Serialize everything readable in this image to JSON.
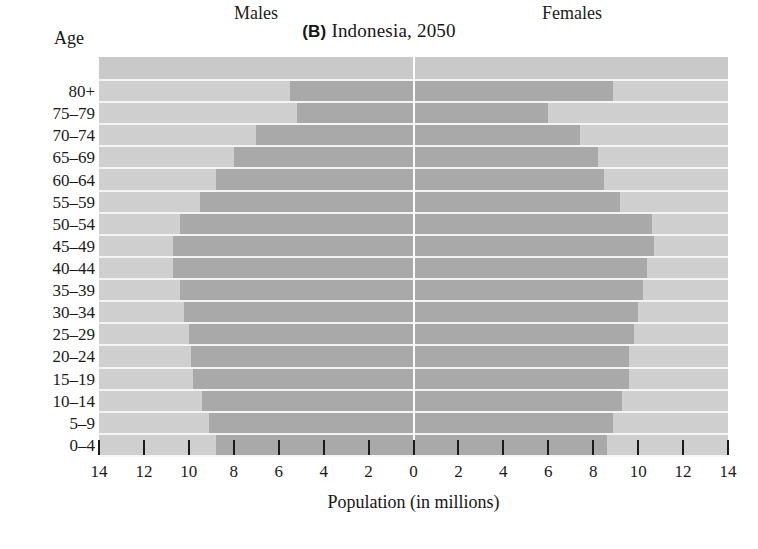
{
  "title": {
    "panel": "(B)",
    "text": "Indonesia, 2050",
    "full": "(B) Indonesia, 2050"
  },
  "axes": {
    "y_title": "Age",
    "x_title": "Population (in millions)",
    "x_ticks": [
      "14",
      "12",
      "10",
      "8",
      "6",
      "4",
      "2",
      "0",
      "2",
      "4",
      "6",
      "8",
      "10",
      "12",
      "14"
    ],
    "x_max": 14,
    "x_center_value": "0"
  },
  "series_headers": {
    "left": "Males",
    "right": "Females"
  },
  "colors": {
    "panel_background": "#cfcfcf",
    "bar": "#a9a9a9",
    "separator": "#f4f4f4",
    "center_line": "#ffffff",
    "text": "#1a1a1a",
    "page_background": "#ffffff"
  },
  "chart_data": {
    "type": "bar",
    "subtype": "population-pyramid",
    "xlabel": "Population (in millions)",
    "ylabel": "Age",
    "xlim": [
      -14,
      14
    ],
    "xticks": [
      -14,
      -12,
      -10,
      -8,
      -6,
      -4,
      -2,
      0,
      2,
      4,
      6,
      8,
      10,
      12,
      14
    ],
    "xticklabels": [
      "14",
      "12",
      "10",
      "8",
      "6",
      "4",
      "2",
      "0",
      "2",
      "4",
      "6",
      "8",
      "10",
      "12",
      "14"
    ],
    "grid": false,
    "legend": "inside-panel-headers",
    "categories": [
      "80+",
      "75-79",
      "70-74",
      "65-69",
      "60-64",
      "55-59",
      "50-54",
      "45-49",
      "40-44",
      "35-39",
      "30-34",
      "25-29",
      "20-24",
      "15-19",
      "10-14",
      "5-9",
      "0-4"
    ],
    "series": [
      {
        "name": "Males",
        "direction": "left",
        "units": "millions",
        "values": [
          5.5,
          5.2,
          7.0,
          8.0,
          8.8,
          9.5,
          10.4,
          10.7,
          10.7,
          10.4,
          10.2,
          10.0,
          9.9,
          9.8,
          9.4,
          9.1,
          8.8
        ]
      },
      {
        "name": "Females",
        "direction": "right",
        "units": "millions",
        "values": [
          8.9,
          6.0,
          7.4,
          8.2,
          8.5,
          9.2,
          10.6,
          10.7,
          10.4,
          10.2,
          10.0,
          9.8,
          9.6,
          9.6,
          9.3,
          8.9,
          8.6
        ]
      }
    ]
  }
}
